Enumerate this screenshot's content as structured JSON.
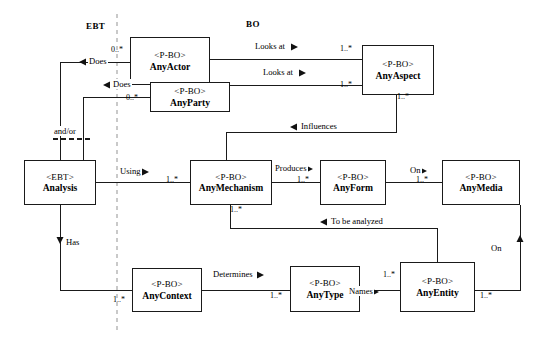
{
  "diagram": {
    "width": 542,
    "height": 342,
    "line_color": "#1a1a1a",
    "background": "#ffffff",
    "divider_color": "#c8c8c8",
    "sections": [
      {
        "id": "ebt",
        "label": "EBT",
        "x": 86,
        "y": 28
      },
      {
        "id": "bo",
        "label": "BO",
        "x": 246,
        "y": 26
      }
    ],
    "nodes": [
      {
        "id": "any_actor",
        "stereotype": "<P-BO>",
        "name": "AnyActor",
        "x": 130,
        "y": 37,
        "w": 80,
        "h": 48
      },
      {
        "id": "any_party",
        "stereotype": "<P-BO>",
        "name": "AnyParty",
        "x": 150,
        "y": 82,
        "w": 80,
        "h": 30
      },
      {
        "id": "any_aspect",
        "stereotype": "<P-BO>",
        "name": "AnyAspect",
        "x": 362,
        "y": 45,
        "w": 72,
        "h": 50
      },
      {
        "id": "analysis",
        "stereotype": "<EBT>",
        "name": "Analysis",
        "x": 24,
        "y": 160,
        "w": 72,
        "h": 45
      },
      {
        "id": "any_mechanism",
        "stereotype": "<P-BO>",
        "name": "AnyMechanism",
        "x": 190,
        "y": 160,
        "w": 82,
        "h": 45
      },
      {
        "id": "any_form",
        "stereotype": "<P-BO>",
        "name": "AnyForm",
        "x": 320,
        "y": 160,
        "w": 66,
        "h": 45
      },
      {
        "id": "any_media",
        "stereotype": "<P-BO>",
        "name": "AnyMedia",
        "x": 442,
        "y": 160,
        "w": 78,
        "h": 45
      },
      {
        "id": "any_context",
        "stereotype": "<P-BO>",
        "name": "AnyContext",
        "x": 132,
        "y": 268,
        "w": 70,
        "h": 44
      },
      {
        "id": "any_type",
        "stereotype": "<P-BO>",
        "name": "AnyType",
        "x": 290,
        "y": 266,
        "w": 70,
        "h": 46
      },
      {
        "id": "any_entity",
        "stereotype": "<P-BO>",
        "name": "AnyEntity",
        "x": 400,
        "y": 262,
        "w": 75,
        "h": 50
      }
    ],
    "relationships": [
      {
        "id": "does_actor",
        "label": "Does",
        "label_x": 88,
        "label_y": 62,
        "arrow": "left"
      },
      {
        "id": "does_party",
        "label": "Does",
        "label_x": 112,
        "label_y": 85,
        "arrow": "left"
      },
      {
        "id": "looks_at_actor",
        "label": "Looks at",
        "label_x": 254,
        "label_y": 47,
        "arrow": "right"
      },
      {
        "id": "looks_at_party",
        "label": "Looks at",
        "label_x": 262,
        "label_y": 73,
        "arrow": "right"
      },
      {
        "id": "influences",
        "label": "Influences",
        "label_x": 300,
        "label_y": 127,
        "arrow": "left"
      },
      {
        "id": "using",
        "label": "Using",
        "label_x": 119,
        "label_y": 172,
        "arrow": "right"
      },
      {
        "id": "produces",
        "label": "Produces",
        "label_x": 274,
        "label_y": 169,
        "arrow": "right"
      },
      {
        "id": "on_media",
        "label": "On",
        "label_x": 409,
        "label_y": 171,
        "arrow": "right"
      },
      {
        "id": "to_be_analyzed",
        "label": "To be analyzed",
        "label_x": 330,
        "label_y": 222,
        "arrow": "left"
      },
      {
        "id": "has",
        "label": "Has",
        "label_x": 65,
        "label_y": 243,
        "arrow": "down"
      },
      {
        "id": "determines",
        "label": "Determines",
        "label_x": 212,
        "label_y": 275,
        "arrow": "right"
      },
      {
        "id": "names",
        "label": "Names",
        "label_x": 348,
        "label_y": 292,
        "arrow": "right"
      },
      {
        "id": "on_entity",
        "label": "On",
        "label_x": 490,
        "label_y": 249,
        "arrow": "up"
      },
      {
        "id": "and_or",
        "label": "and/or",
        "label_x": 53,
        "label_y": 132,
        "arrow": "none"
      }
    ],
    "multiplicities": [
      {
        "id": "m_actor_left",
        "text": "0..*",
        "x": 111,
        "y": 50
      },
      {
        "id": "m_party_left",
        "text": "0..*",
        "x": 126,
        "y": 98
      },
      {
        "id": "m_aspect_top",
        "text": "1..*",
        "x": 340,
        "y": 50
      },
      {
        "id": "m_aspect_bottom",
        "text": "1..*",
        "x": 340,
        "y": 86
      },
      {
        "id": "m_aspect_down",
        "text": "1..*",
        "x": 397,
        "y": 97
      },
      {
        "id": "m_mech_left",
        "text": "1..*",
        "x": 166,
        "y": 180
      },
      {
        "id": "m_form_left",
        "text": "1..*",
        "x": 297,
        "y": 180
      },
      {
        "id": "m_media_left",
        "text": "1..*",
        "x": 416,
        "y": 180
      },
      {
        "id": "m_mech_bottom",
        "text": "1..*",
        "x": 230,
        "y": 210
      },
      {
        "id": "m_context_left",
        "text": "1..*",
        "x": 113,
        "y": 300
      },
      {
        "id": "m_type_left",
        "text": "1..*",
        "x": 270,
        "y": 296
      },
      {
        "id": "m_entity_top",
        "text": "1..*",
        "x": 383,
        "y": 275
      },
      {
        "id": "m_entity_right",
        "text": "1..*",
        "x": 480,
        "y": 296
      }
    ]
  }
}
